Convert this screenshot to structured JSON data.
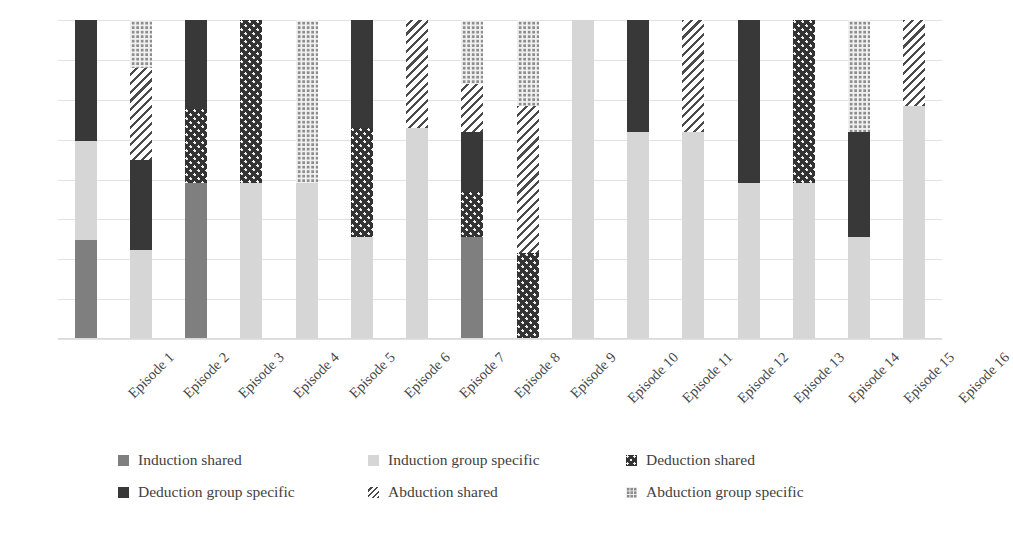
{
  "chart_data": {
    "type": "bar",
    "subtype": "stacked-bar",
    "title": "",
    "xlabel": "",
    "ylabel": "Dorst equations + culture",
    "grid": true,
    "gridline_count": 8,
    "legend_position": "bottom",
    "axis_label_rotation": -45,
    "ylim": [
      0,
      100
    ],
    "y_ticks_visible": false,
    "categories": [
      "Episode 1",
      "Episode 2",
      "Episode 3",
      "Episode 4",
      "Episode 5",
      "Episode 6",
      "Episode 7",
      "Episode 8",
      "Episode 9",
      "Episode 10",
      "Episode 11",
      "Episode 12",
      "Episode 13",
      "Episode 14",
      "Episode 15",
      "Episode 16"
    ],
    "series": [
      {
        "name": "Induction shared",
        "key": "induction-shared",
        "color": "#7f7f7f",
        "pattern": "solid",
        "values": [
          31,
          0,
          49,
          0,
          0,
          0,
          0,
          32,
          0,
          0,
          0,
          0,
          0,
          0,
          0,
          0
        ]
      },
      {
        "name": "Induction group specific",
        "key": "induction-group-specific",
        "color": "#d6d6d6",
        "pattern": "solid",
        "values": [
          31,
          28,
          0,
          49,
          49,
          32,
          66,
          0,
          0,
          100,
          65,
          65,
          49,
          49,
          32,
          73
        ]
      },
      {
        "name": "Deduction shared",
        "key": "deduction-shared",
        "color": "#333333",
        "pattern": "dots",
        "values": [
          0,
          0,
          23,
          51,
          0,
          34,
          0,
          14,
          27,
          0,
          0,
          0,
          0,
          51,
          0,
          0
        ]
      },
      {
        "name": "Deduction group specific",
        "key": "deduction-group-specific",
        "color": "#383838",
        "pattern": "solid",
        "values": [
          38,
          28,
          28,
          0,
          0,
          34,
          0,
          19,
          0,
          0,
          35,
          0,
          51,
          0,
          33,
          0
        ]
      },
      {
        "name": "Abduction shared",
        "key": "abduction-shared",
        "color": "#4a4a4a",
        "pattern": "diagonal-hatch",
        "values": [
          0,
          29,
          0,
          0,
          0,
          0,
          34,
          15,
          46,
          0,
          0,
          35,
          0,
          0,
          0,
          27
        ]
      },
      {
        "name": "Abduction group specific",
        "key": "abduction-group-specific",
        "color": "#8d8d8d",
        "pattern": "grid",
        "values": [
          0,
          15,
          0,
          0,
          51,
          0,
          0,
          20,
          27,
          0,
          0,
          0,
          0,
          0,
          35,
          0
        ]
      }
    ]
  },
  "legend": {
    "items": [
      {
        "label": "Induction shared",
        "key": "induction-shared"
      },
      {
        "label": "Induction group specific",
        "key": "induction-group-specific"
      },
      {
        "label": "Deduction shared",
        "key": "deduction-shared"
      },
      {
        "label": "Deduction group specific",
        "key": "deduction-group-specific"
      },
      {
        "label": "Abduction shared",
        "key": "abduction-shared"
      },
      {
        "label": "Abduction group specific",
        "key": "abduction-group-specific"
      }
    ]
  }
}
